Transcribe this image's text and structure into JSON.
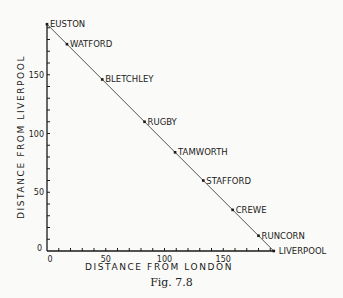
{
  "chart_data": {
    "type": "line",
    "title": "",
    "caption": "Fig. 7.8",
    "xlabel": "DISTANCE FROM LONDON",
    "ylabel": "DISTANCE FROM LIVERPOOL",
    "xlim": [
      0,
      193
    ],
    "ylim": [
      0,
      193
    ],
    "x_ticks": [
      0,
      50,
      100,
      150
    ],
    "y_ticks": [
      0,
      50,
      100,
      150
    ],
    "minor_tick_step": 10,
    "grid": false,
    "legend": null,
    "series": [
      {
        "name": "Stations",
        "points": [
          {
            "label": "EUSTON",
            "x": 0,
            "y": 193
          },
          {
            "label": "WATFORD",
            "x": 17,
            "y": 176
          },
          {
            "label": "BLETCHLEY",
            "x": 47,
            "y": 146
          },
          {
            "label": "RUGBY",
            "x": 83,
            "y": 110
          },
          {
            "label": "TAMWORTH",
            "x": 109,
            "y": 84
          },
          {
            "label": "STAFFORD",
            "x": 133,
            "y": 60
          },
          {
            "label": "CREWE",
            "x": 158,
            "y": 35
          },
          {
            "label": "RUNCORN",
            "x": 180,
            "y": 13
          },
          {
            "label": "LIVERPOOL",
            "x": 193,
            "y": 0
          }
        ]
      }
    ]
  },
  "figure": {
    "caption": "Fig. 7.8"
  },
  "colors": {
    "ink": "#1a1a1a",
    "line": "#555555",
    "paper": "#fafaf8"
  }
}
